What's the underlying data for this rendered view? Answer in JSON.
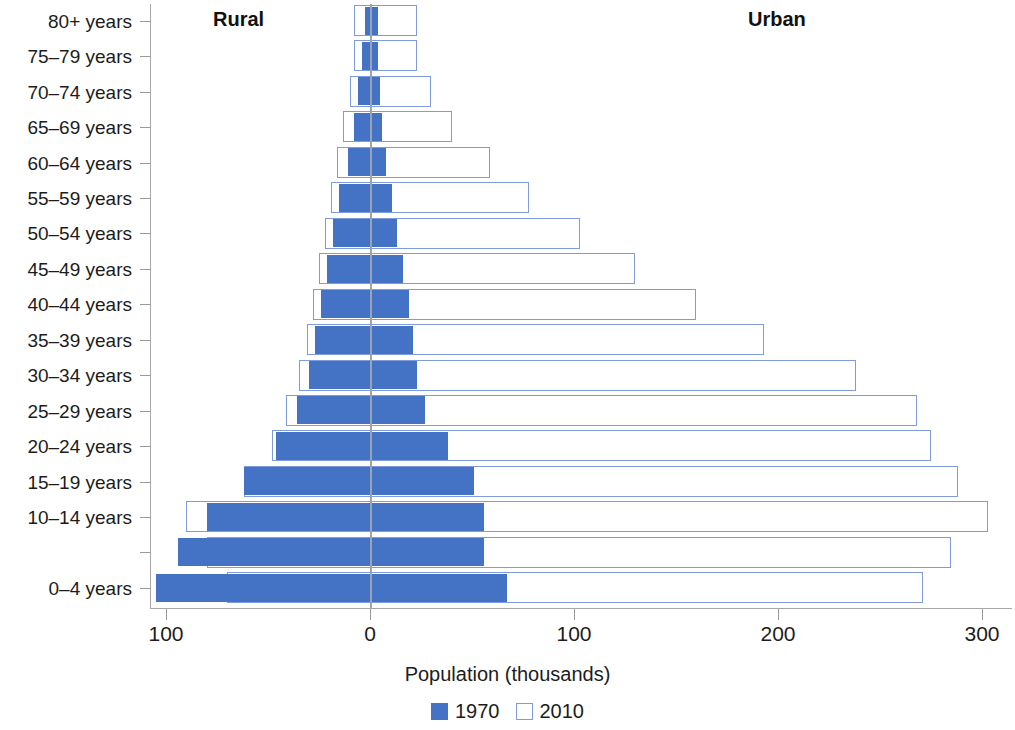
{
  "chart_data": {
    "type": "bar",
    "subtype": "population-pyramid",
    "title": "",
    "xlabel": "Population (thousands)",
    "ylabel": "",
    "xlim": [
      -105,
      310
    ],
    "xticks": [
      -100,
      0,
      100,
      200,
      300
    ],
    "xtick_labels": [
      "100",
      "0",
      "100",
      "200",
      "300"
    ],
    "grid": false,
    "side_labels": {
      "left": "Rural",
      "right": "Urban"
    },
    "legend": {
      "position": "bottom-center",
      "entries": [
        {
          "label": "1970",
          "style": "filled",
          "color": "#4472C4"
        },
        {
          "label": "2010",
          "style": "outline",
          "color": "#7D9BDD"
        }
      ]
    },
    "categories": [
      "0–4 years",
      "5–9 years",
      "10–14 years",
      "15–19 years",
      "20–24 years",
      "25–29 years",
      "30–34 years",
      "35–39 years",
      "40–44 years",
      "45–49 years",
      "50–54 years",
      "55–59 years",
      "60–64 years",
      "65–69 years",
      "70–74 years",
      "75–79 years",
      "80+ years"
    ],
    "visible_category_labels": [
      "0–4 years",
      "10–14 years",
      "15–19 years",
      "20–24 years",
      "25–29 years",
      "30–34 years",
      "35–39 years",
      "40–44 years",
      "45–49 years",
      "50–54 years",
      "55–59 years",
      "60–64 years",
      "65–69 years",
      "70–74 years",
      "75–79 years",
      "80+ years"
    ],
    "series": [
      {
        "name": "1970",
        "style": "filled",
        "rural": [
          105,
          94,
          80,
          62,
          46,
          36,
          30,
          27,
          24,
          21,
          18,
          15,
          11,
          8,
          6,
          4,
          2.5
        ],
        "urban": [
          67,
          56,
          56,
          51,
          38,
          27,
          23,
          21,
          19,
          16,
          13,
          11,
          8,
          6,
          5,
          4,
          4
        ]
      },
      {
        "name": "2010",
        "style": "outline",
        "rural": [
          70,
          80,
          90,
          62,
          48,
          41,
          35,
          31,
          28,
          25,
          22,
          19,
          16,
          13,
          10,
          8,
          8
        ],
        "urban": [
          271,
          285,
          303,
          288,
          275,
          268,
          238,
          193,
          160,
          130,
          103,
          78,
          59,
          40,
          30,
          23,
          23
        ]
      }
    ]
  }
}
